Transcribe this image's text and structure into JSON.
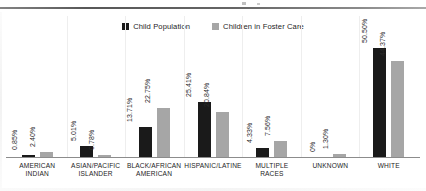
{
  "legend": {
    "position": "top-center",
    "entries": [
      {
        "label": "Child Population",
        "color": "#1a1a1a",
        "swatch": "square-black-icon"
      },
      {
        "label": "Children in Foster Care",
        "color": "#a6a6a6",
        "swatch": "square-gray-icon"
      }
    ]
  },
  "chart_data": {
    "type": "bar",
    "title": "",
    "subtitle": "",
    "xlabel": "",
    "ylabel": "",
    "grid": false,
    "legend_position": "top-center",
    "ylim": [
      0,
      55
    ],
    "value_suffix": "%",
    "categories": [
      "AMERICAN INDIAN",
      "ASIAN/PACIFIC ISLANDER",
      "BLACK/AFRICAN AMERICAN",
      "HISPANIC/LATINE",
      "MULTIPLE RACES",
      "UNKNOWN",
      "WHITE"
    ],
    "series": [
      {
        "name": "Child Population",
        "color": "#1a1a1a",
        "values": [
          0.85,
          5.01,
          13.71,
          25.41,
          4.33,
          0,
          50.5
        ],
        "labels": [
          "0.85%",
          "5.01%",
          "13.71%",
          "25.41%",
          "4.33%",
          "0%",
          "50.50%"
        ]
      },
      {
        "name": "Children in Foster Care",
        "color": "#a6a6a6",
        "values": [
          2.4,
          0.78,
          22.75,
          20.84,
          7.56,
          1.3,
          44.37
        ],
        "labels": [
          "2.40%",
          "0.78%",
          "22.75%",
          "20.84%",
          "7.56%",
          "1.30%",
          "44.37%"
        ]
      }
    ]
  }
}
